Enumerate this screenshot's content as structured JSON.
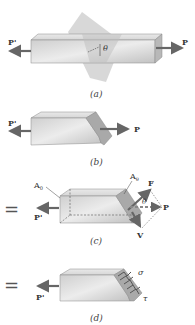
{
  "figure": {
    "panels": [
      {
        "id": "a",
        "caption": "(a)",
        "labels": {
          "left_force": "P'",
          "right_force": "P",
          "angle": "θ"
        }
      },
      {
        "id": "b",
        "caption": "(b)",
        "labels": {
          "left_force": "P'",
          "right_force": "P"
        }
      },
      {
        "id": "c",
        "caption": "(c)",
        "labels": {
          "left_force": "P'",
          "right_force": "P",
          "left_area": "A",
          "left_area_sub": "0",
          "right_area": "A",
          "right_area_sub": "θ",
          "resultant": "F",
          "shear": "V",
          "angle": "θ"
        },
        "prefix": "="
      },
      {
        "id": "d",
        "caption": "(d)",
        "labels": {
          "left_force": "P'",
          "normal_stress": "σ",
          "shear_stress": "τ"
        },
        "prefix": "="
      }
    ],
    "colors": {
      "block": "#c9c9c9",
      "block_light": "#e6e6e6",
      "arrow": "#666666",
      "plane": "#bdbdbd"
    }
  }
}
